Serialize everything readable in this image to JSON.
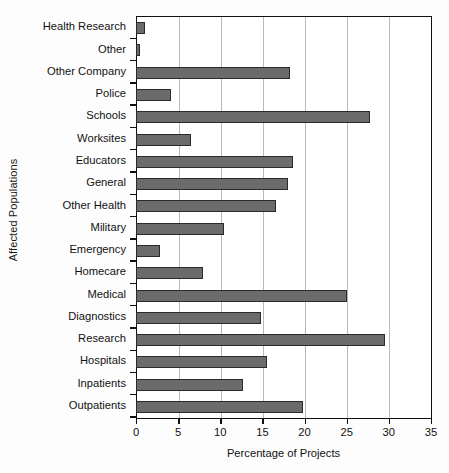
{
  "chart_data": {
    "type": "bar",
    "orientation": "horizontal",
    "title": "",
    "xlabel": "Percentage of Projects",
    "ylabel": "Affected Populations",
    "xlim": [
      0,
      35
    ],
    "xticks": [
      0,
      5,
      10,
      15,
      20,
      25,
      30,
      35
    ],
    "xtick_labels": [
      "0",
      "5",
      "10",
      "15",
      "20",
      "25",
      "30",
      "35"
    ],
    "grid": "vertical",
    "legend": "none",
    "bar_color": "#6b6b6b",
    "bar_edge_color": "#2a2a2a",
    "grid_color": "#b9b9b9",
    "axis_color": "#101010",
    "categories": [
      "Health Research",
      "Other",
      "Other Company",
      "Police",
      "Schools",
      "Worksites",
      "Educators",
      "General",
      "Other Health",
      "Military",
      "Emergency",
      "Homecare",
      "Medical",
      "Diagnostics",
      "Research",
      "Hospitals",
      "Inpatients",
      "Outpatients"
    ],
    "values": [
      1.1,
      0.5,
      18.3,
      4.2,
      27.9,
      6.5,
      18.7,
      18.1,
      16.7,
      10.5,
      2.9,
      8.0,
      25.1,
      14.9,
      29.6,
      15.6,
      12.7,
      19.9
    ]
  }
}
